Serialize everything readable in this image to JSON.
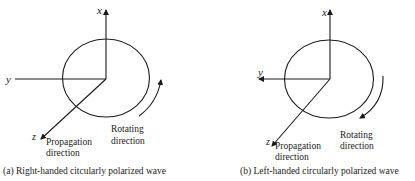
{
  "colors": {
    "stroke": "#1a1a1a",
    "text": "#222222",
    "background": "#ffffff"
  },
  "panels": [
    {
      "id": "a",
      "caption": "(a) Right-handed citcularly polarized wave",
      "axes": {
        "x": "x",
        "y": "y",
        "z": "z"
      },
      "propagation_label_1": "Propagation",
      "propagation_label_2": "direction",
      "rotating_label_1": "Rotating",
      "rotating_label_2": "direction",
      "rotation_sense": "counter-clockwise arrow pointing up"
    },
    {
      "id": "b",
      "caption": "(b) Left-handed circularly polarized wave",
      "axes": {
        "x": "x",
        "y": "y",
        "z": "z"
      },
      "propagation_label_1": "Propagation",
      "propagation_label_2": "direction",
      "rotating_label_1": "Rotating",
      "rotating_label_2": "direction",
      "rotation_sense": "clockwise arrow pointing down"
    }
  ]
}
